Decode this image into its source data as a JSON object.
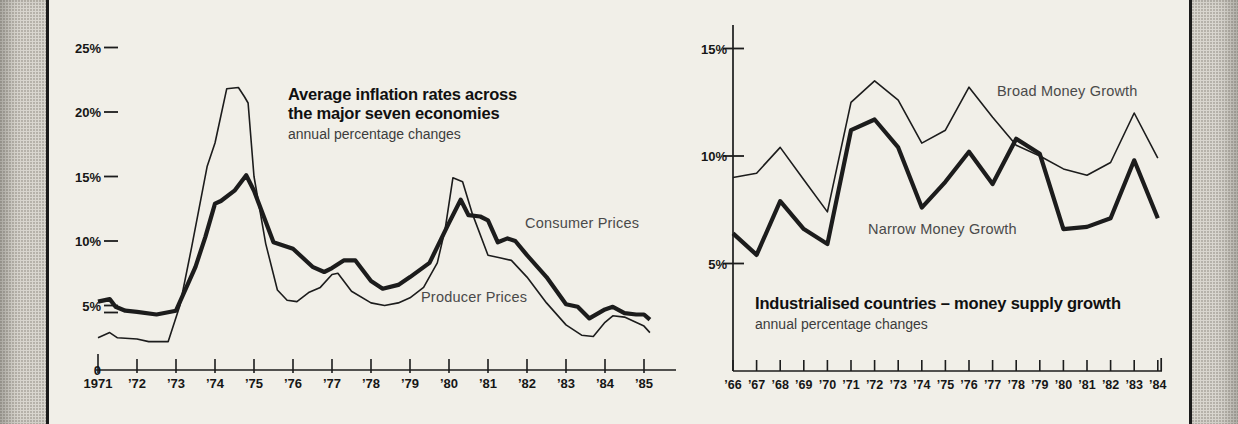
{
  "frame": {
    "page_bg": "#f1efe8",
    "edge_texture_bg": "#d9d6cf",
    "edge_texture_dot": "#b6b2aa",
    "rule_color": "#1a1a1a",
    "ink_color": "#1c1c1c",
    "muted_text_color": "#4a4a4a"
  },
  "charts": [
    {
      "id": "inflation",
      "title_lines": [
        "Average inflation rates across",
        "the major seven economies"
      ],
      "subtitle": "annual percentage changes",
      "series_labels": [
        {
          "text": "Consumer Prices",
          "x": 525,
          "y": 215
        },
        {
          "text": "Producer Prices",
          "x": 421,
          "y": 289
        }
      ],
      "chart_data": {
        "type": "line",
        "title": "Average inflation rates across the major seven economies",
        "subtitle": "annual percentage changes",
        "grid": false,
        "legend_position": "inline-labels",
        "x_axis": {
          "labels": [
            "1971",
            "’72",
            "’73",
            "’74",
            "’75",
            "’76",
            "’77",
            "’78",
            "’79",
            "’80",
            "’81",
            "’82",
            "’83",
            "’84",
            "’85"
          ],
          "year_min": 1971,
          "year_max": 1985
        },
        "y_axis": {
          "unit": "percent, annual change",
          "ylim": [
            0,
            26
          ],
          "labels": [
            {
              "text": "25%",
              "value": 25,
              "dash": true
            },
            {
              "text": "20%",
              "value": 20,
              "dash": true
            },
            {
              "text": "15%",
              "value": 15,
              "dash": true
            },
            {
              "text": "10%",
              "value": 10,
              "dash": true
            },
            {
              "text": "5%",
              "value": 5,
              "dash": true,
              "double_dash": true
            },
            {
              "text": "0",
              "value": 0,
              "dash": false
            }
          ]
        },
        "series": [
          {
            "name": "Producer Prices",
            "style": "thin",
            "points": [
              [
                1971.0,
                2.5
              ],
              [
                1971.3,
                2.9
              ],
              [
                1971.5,
                2.5
              ],
              [
                1972.0,
                2.4
              ],
              [
                1972.3,
                2.2
              ],
              [
                1972.8,
                2.2
              ],
              [
                1973.1,
                5.0
              ],
              [
                1973.4,
                9.5
              ],
              [
                1973.8,
                15.8
              ],
              [
                1974.0,
                17.6
              ],
              [
                1974.3,
                21.8
              ],
              [
                1974.6,
                21.9
              ],
              [
                1974.75,
                21.2
              ],
              [
                1974.85,
                20.7
              ],
              [
                1975.0,
                15.0
              ],
              [
                1975.3,
                9.8
              ],
              [
                1975.6,
                6.2
              ],
              [
                1975.85,
                5.4
              ],
              [
                1976.1,
                5.3
              ],
              [
                1976.4,
                6.0
              ],
              [
                1976.7,
                6.4
              ],
              [
                1977.0,
                7.4
              ],
              [
                1977.15,
                7.5
              ],
              [
                1977.5,
                6.1
              ],
              [
                1978.0,
                5.2
              ],
              [
                1978.35,
                5.0
              ],
              [
                1978.7,
                5.2
              ],
              [
                1979.0,
                5.6
              ],
              [
                1979.35,
                6.4
              ],
              [
                1979.7,
                8.3
              ],
              [
                1979.9,
                10.9
              ],
              [
                1980.1,
                14.9
              ],
              [
                1980.35,
                14.6
              ],
              [
                1980.6,
                12.1
              ],
              [
                1981.0,
                8.9
              ],
              [
                1981.3,
                8.7
              ],
              [
                1981.6,
                8.5
              ],
              [
                1982.0,
                7.2
              ],
              [
                1982.5,
                5.2
              ],
              [
                1983.0,
                3.5
              ],
              [
                1983.4,
                2.7
              ],
              [
                1983.7,
                2.6
              ],
              [
                1984.0,
                3.7
              ],
              [
                1984.2,
                4.2
              ],
              [
                1984.5,
                4.1
              ],
              [
                1985.0,
                3.4
              ],
              [
                1985.15,
                2.9
              ]
            ]
          },
          {
            "name": "Consumer Prices",
            "style": "thick",
            "points": [
              [
                1971.0,
                5.3
              ],
              [
                1971.3,
                5.5
              ],
              [
                1971.45,
                4.9
              ],
              [
                1971.7,
                4.6
              ],
              [
                1972.0,
                4.5
              ],
              [
                1972.5,
                4.3
              ],
              [
                1973.0,
                4.6
              ],
              [
                1973.5,
                8.0
              ],
              [
                1973.75,
                10.3
              ],
              [
                1974.0,
                12.9
              ],
              [
                1974.15,
                13.1
              ],
              [
                1974.5,
                13.9
              ],
              [
                1974.8,
                15.1
              ],
              [
                1975.0,
                13.9
              ],
              [
                1975.5,
                9.9
              ],
              [
                1976.0,
                9.4
              ],
              [
                1976.5,
                8.0
              ],
              [
                1976.8,
                7.6
              ],
              [
                1977.0,
                7.9
              ],
              [
                1977.3,
                8.5
              ],
              [
                1977.6,
                8.5
              ],
              [
                1978.0,
                6.9
              ],
              [
                1978.3,
                6.3
              ],
              [
                1978.7,
                6.6
              ],
              [
                1979.0,
                7.2
              ],
              [
                1979.5,
                8.3
              ],
              [
                1980.0,
                11.4
              ],
              [
                1980.3,
                13.2
              ],
              [
                1980.5,
                12.0
              ],
              [
                1980.8,
                11.9
              ],
              [
                1981.0,
                11.6
              ],
              [
                1981.25,
                9.9
              ],
              [
                1981.5,
                10.2
              ],
              [
                1981.7,
                10.0
              ],
              [
                1982.0,
                8.9
              ],
              [
                1982.5,
                7.2
              ],
              [
                1983.0,
                5.1
              ],
              [
                1983.3,
                4.9
              ],
              [
                1983.6,
                4.0
              ],
              [
                1984.0,
                4.7
              ],
              [
                1984.2,
                4.9
              ],
              [
                1984.5,
                4.4
              ],
              [
                1984.8,
                4.3
              ],
              [
                1985.0,
                4.3
              ],
              [
                1985.15,
                3.9
              ]
            ]
          }
        ],
        "layout": {
          "x_start": 98,
          "x_per_year": 39.0,
          "y_zero": 370,
          "y_per_pct": 12.9,
          "axis_from": 96,
          "axis_to": 676,
          "label_right_x": 101,
          "dash_x1": 104,
          "dash_x2": 118,
          "tick_up": 11,
          "tick_down": 3,
          "first_tick_up": 16,
          "x_label_size": 13,
          "y_label_size": 13
        }
      }
    },
    {
      "id": "money",
      "title_lines": [
        "Industrialised countries – money supply growth"
      ],
      "subtitle": "annual percentage changes",
      "series_labels": [
        {
          "text": "Broad Money Growth",
          "x": 997,
          "y": 83
        },
        {
          "text": "Narrow Money Growth",
          "x": 868,
          "y": 221
        }
      ],
      "chart_data": {
        "type": "line",
        "title": "Industrialised countries – money supply growth",
        "subtitle": "annual percentage changes",
        "grid": false,
        "legend_position": "inline-labels",
        "x_axis": {
          "labels": [
            "’66",
            "’67",
            "’68",
            "’69",
            "’70",
            "’71",
            "’72",
            "’73",
            "’74",
            "’75",
            "’76",
            "’77",
            "’78",
            "’79",
            "’80",
            "’81",
            "’82",
            "’83",
            "’84"
          ],
          "year_min": 1966,
          "year_max": 1984
        },
        "y_axis": {
          "unit": "percent, annual change",
          "ylim": [
            0,
            16
          ],
          "labels": [
            {
              "text": "15%",
              "value": 15,
              "dash": true
            },
            {
              "text": "10%",
              "value": 10,
              "dash": true
            },
            {
              "text": "5%",
              "value": 5,
              "dash": true
            }
          ]
        },
        "categories": [
          1966,
          1967,
          1968,
          1969,
          1970,
          1971,
          1972,
          1973,
          1974,
          1975,
          1976,
          1977,
          1978,
          1979,
          1980,
          1981,
          1982,
          1983,
          1984
        ],
        "series": [
          {
            "name": "Broad Money Growth",
            "style": "thin",
            "values": [
              9.0,
              9.2,
              10.4,
              8.9,
              7.4,
              12.5,
              13.5,
              12.6,
              10.6,
              11.2,
              13.2,
              11.8,
              10.5,
              10.0,
              9.4,
              9.1,
              9.7,
              12.0,
              9.9
            ]
          },
          {
            "name": "Narrow Money Growth",
            "style": "thick",
            "values": [
              6.4,
              5.4,
              7.9,
              6.6,
              5.9,
              11.2,
              11.7,
              10.4,
              7.6,
              8.8,
              10.2,
              8.7,
              10.8,
              10.1,
              6.6,
              6.7,
              7.1,
              9.8,
              7.1
            ]
          }
        ],
        "layout": {
          "x_start": 733,
          "x_per_year": 23.6,
          "y_zero": 371,
          "y_per_pct": 21.5,
          "axis_from": 733,
          "axis_to": 1162,
          "y_axis_top": 25,
          "end_upturn": 13,
          "label_right_x": 727,
          "dash_x1": 723,
          "dash_x2": 744,
          "tick_up": 11,
          "tick_down": 0,
          "x_label_size": 12.5,
          "y_label_size": 13
        }
      }
    }
  ]
}
